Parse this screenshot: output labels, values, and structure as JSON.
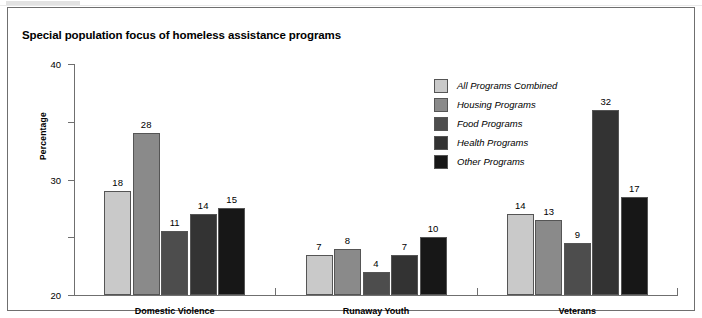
{
  "chart_data": {
    "type": "bar",
    "title": "Special population focus of homeless assistance programs",
    "xlabel": "",
    "ylabel": "Percentage",
    "ylim": [
      0,
      40
    ],
    "yticks": [
      0,
      10,
      20,
      30,
      40
    ],
    "ytick_labels": [
      "0",
      "10",
      "20",
      "30",
      "40"
    ],
    "grid": false,
    "legend_position": "upper-right-inside",
    "categories": [
      "Domestic Violence",
      "Runaway Youth",
      "Veterans"
    ],
    "series": [
      {
        "name": "All Programs Combined",
        "color": "#c9c9c9",
        "values": [
          18,
          7,
          14
        ]
      },
      {
        "name": "Housing Programs",
        "color": "#8a8a8a",
        "values": [
          28,
          8,
          13
        ]
      },
      {
        "name": "Food Programs",
        "color": "#4d4d4d",
        "values": [
          11,
          4,
          9
        ]
      },
      {
        "name": "Health Programs",
        "color": "#333333",
        "values": [
          14,
          7,
          32
        ]
      },
      {
        "name": "Other Programs",
        "color": "#171717",
        "values": [
          15,
          10,
          17
        ]
      }
    ]
  }
}
